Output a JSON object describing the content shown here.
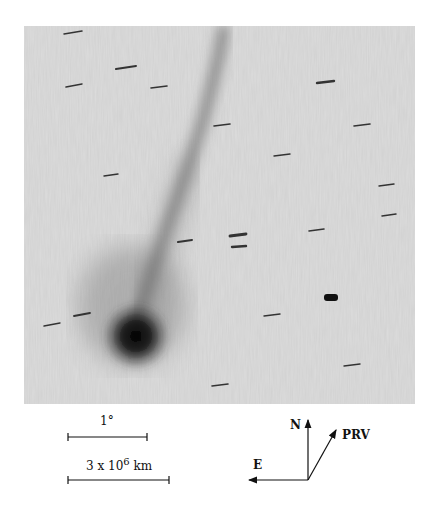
{
  "figure": {
    "image_description": "Grayscale negative astronomical image of a comet with a long narrow ion tail and trailed background stars",
    "scale_bars": [
      {
        "label": "1°",
        "x1": 68,
        "x2": 147,
        "y": 437
      },
      {
        "label_base": "3 x 10",
        "label_exp": "6",
        "label_unit": "km",
        "x1": 68,
        "x2": 169,
        "y": 480
      }
    ],
    "compass": {
      "north_label": "N",
      "east_label": "E",
      "prv_label": "PRV"
    },
    "colors": {
      "background": "#ffffff",
      "sky": "#d8d8d8",
      "ink": "#111111"
    }
  }
}
